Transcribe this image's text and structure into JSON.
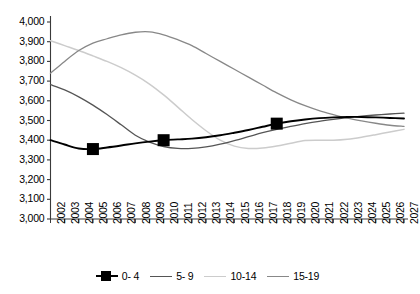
{
  "chart_data": {
    "type": "line",
    "title": "",
    "xlabel": "",
    "ylabel": "",
    "ylim": [
      3000,
      4000
    ],
    "grid": false,
    "legend_position": "bottom",
    "categories": [
      "2002",
      "2003",
      "2004",
      "2005",
      "2006",
      "2007",
      "2008",
      "2009",
      "2010",
      "2011",
      "2012",
      "2013",
      "2014",
      "2015",
      "2016",
      "2017",
      "2018",
      "2019",
      "2020",
      "2021",
      "2022",
      "2023",
      "2024",
      "2025",
      "2026",
      "2027"
    ],
    "ytick_labels": [
      "4,000",
      "3,900",
      "3,800",
      "3,700",
      "3,600",
      "3,500",
      "3,400",
      "3,300",
      "3,200",
      "3,100",
      "3,000"
    ],
    "ytick_values": [
      4000,
      3900,
      3800,
      3700,
      3600,
      3500,
      3400,
      3300,
      3200,
      3100,
      3000
    ],
    "series": [
      {
        "name": "0- 4",
        "color": "#000000",
        "width": 1.9,
        "marker": "square",
        "marker_points": [
          2005,
          2010,
          2018
        ],
        "values": [
          3400,
          3378,
          3358,
          3355,
          3363,
          3373,
          3384,
          3393,
          3400,
          3404,
          3408,
          3415,
          3425,
          3438,
          3452,
          3468,
          3484,
          3496,
          3505,
          3512,
          3516,
          3518,
          3518,
          3516,
          3513,
          3510
        ]
      },
      {
        "name": "5- 9",
        "color": "#555555",
        "width": 1.3,
        "marker": "none",
        "values": [
          3682,
          3655,
          3620,
          3578,
          3530,
          3478,
          3425,
          3390,
          3368,
          3358,
          3358,
          3366,
          3380,
          3398,
          3418,
          3438,
          3455,
          3470,
          3484,
          3496,
          3506,
          3515,
          3522,
          3528,
          3533,
          3537
        ]
      },
      {
        "name": "10-14",
        "color": "#cccccc",
        "width": 1.5,
        "marker": "none",
        "values": [
          3905,
          3880,
          3855,
          3828,
          3800,
          3768,
          3730,
          3685,
          3630,
          3568,
          3505,
          3448,
          3400,
          3370,
          3358,
          3360,
          3370,
          3385,
          3398,
          3400,
          3400,
          3405,
          3415,
          3428,
          3442,
          3455
        ]
      },
      {
        "name": "15-19",
        "color": "#888888",
        "width": 1.3,
        "marker": "none",
        "values": [
          3740,
          3800,
          3855,
          3893,
          3915,
          3935,
          3948,
          3950,
          3935,
          3910,
          3880,
          3840,
          3800,
          3760,
          3720,
          3680,
          3640,
          3605,
          3575,
          3550,
          3530,
          3512,
          3498,
          3486,
          3476,
          3470
        ]
      }
    ]
  },
  "legend": {
    "items": [
      {
        "label": "0- 4"
      },
      {
        "label": "5- 9"
      },
      {
        "label": "10-14"
      },
      {
        "label": "15-19"
      }
    ]
  }
}
